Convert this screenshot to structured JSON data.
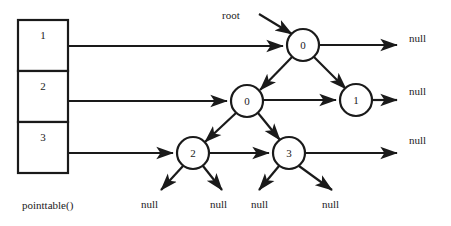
{
  "figure": {
    "kind": "binary-tree-with-pointer-table",
    "caption": "pointtable()",
    "root_label": "root",
    "colors": {
      "stroke": "#1a1a1a",
      "background": "#ffffff",
      "text": "#1a1a1a"
    }
  },
  "pointer_table": {
    "caption": "pointtable()",
    "rows": [
      {
        "label": "1"
      },
      {
        "label": "2"
      },
      {
        "label": "3"
      }
    ]
  },
  "tree": {
    "nodes": [
      {
        "id": "n0",
        "label": "0",
        "level": 1,
        "cx": 303,
        "cy": 45,
        "r": 16
      },
      {
        "id": "n1",
        "label": "0",
        "level": 2,
        "cx": 247,
        "cy": 101,
        "r": 16
      },
      {
        "id": "n2",
        "label": "1",
        "level": 2,
        "cx": 356,
        "cy": 100,
        "r": 16
      },
      {
        "id": "n3",
        "label": "2",
        "level": 3,
        "cx": 193,
        "cy": 153,
        "r": 16
      },
      {
        "id": "n4",
        "label": "3",
        "level": 3,
        "cx": 289,
        "cy": 153,
        "r": 16
      }
    ],
    "edges": [
      {
        "from": "n0",
        "to": "n1",
        "type": "child-left"
      },
      {
        "from": "n0",
        "to": "n2",
        "type": "child-right"
      },
      {
        "from": "n1",
        "to": "n3",
        "type": "child-left"
      },
      {
        "from": "n1",
        "to": "n4",
        "type": "child-right"
      },
      {
        "from": "n1",
        "to": "n2",
        "type": "next-horizontal"
      },
      {
        "from": "n3",
        "to": "n4",
        "type": "next-horizontal"
      }
    ]
  },
  "null_labels": {
    "right": [
      {
        "text": "null",
        "x": 410,
        "y": 38
      },
      {
        "text": "null",
        "x": 410,
        "y": 91
      },
      {
        "text": "null",
        "x": 410,
        "y": 140
      }
    ],
    "bottom": [
      {
        "text": "null",
        "x": 155,
        "y": 205
      },
      {
        "text": "null",
        "x": 224,
        "y": 205
      },
      {
        "text": "null",
        "x": 265,
        "y": 205
      },
      {
        "text": "null",
        "x": 336,
        "y": 205
      }
    ]
  }
}
